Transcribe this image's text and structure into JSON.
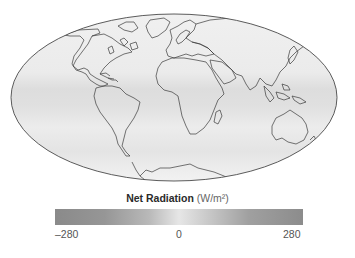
{
  "figure": {
    "projection": "Mollweide world map",
    "colors": {
      "background": "#ffffff",
      "map_fill": "#ececec",
      "tropical_band": "#dcdcdc",
      "coastline": "#3a3a3a",
      "colorbar_min": "#8a8a8a",
      "colorbar_mid": "#e6e6e6",
      "colorbar_max": "#8c8c8c"
    }
  },
  "legend": {
    "title_bold": "Net Radiation",
    "title_unit": "(W/m²)",
    "ticks": {
      "min": "–280",
      "mid": "0",
      "max": "280"
    },
    "range": [
      -280,
      280
    ]
  }
}
